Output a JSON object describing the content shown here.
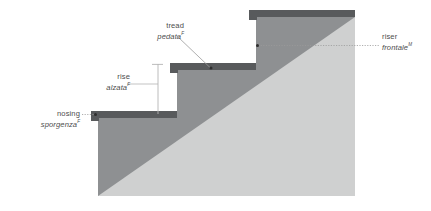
{
  "diagram": {
    "colors": {
      "slab_dark": "#585a5c",
      "body_mid": "#8e9092",
      "body_light": "#cfd0d0",
      "leader_line": "#9a9a9a",
      "dimension_line": "#b4b4b4",
      "text": "#4d4d4d",
      "marker_dot": "#2e2e2e",
      "background": "#ffffff"
    },
    "labels": [
      {
        "id": "nosing",
        "english": "nosing",
        "italian": "sporgenza",
        "superscript": "F",
        "align": "right",
        "leader": "dotted-horizontal-to-left-slab-edge",
        "marker": "dot"
      },
      {
        "id": "rise",
        "english": "rise",
        "italian": "alzata",
        "superscript": "F",
        "align": "right",
        "leader": "dimension-line-vertical",
        "marker": "none"
      },
      {
        "id": "tread",
        "english": "tread",
        "italian": "pedata",
        "superscript": "F",
        "align": "right",
        "leader": "diagonal-to-middle-slab",
        "marker": "dot"
      },
      {
        "id": "riser",
        "english": "riser",
        "italian": "frontale",
        "superscript": "M",
        "align": "left",
        "leader": "dotted-horizontal-to-riser-face",
        "marker": "dot"
      }
    ]
  }
}
